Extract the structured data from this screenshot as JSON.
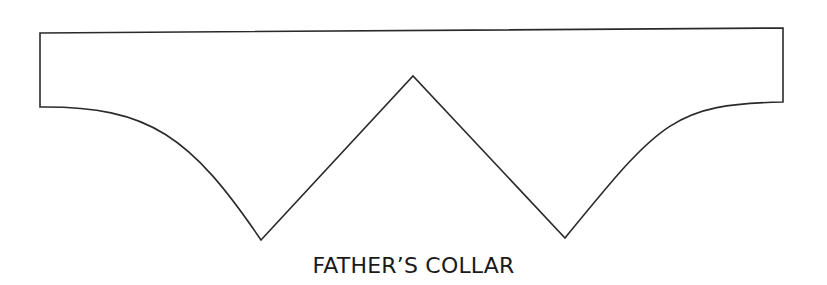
{
  "diagram": {
    "caption": "FATHER’S COLLAR",
    "stroke_color": "#2a2a2a",
    "background_color": "#ffffff",
    "shape": {
      "name": "collar-pattern-outline",
      "points": {
        "top_left": [
          40,
          33
        ],
        "top_right": [
          783,
          28
        ],
        "right_bottom": [
          783,
          102
        ],
        "right_v_tip": [
          565,
          238
        ],
        "apex": [
          413,
          76
        ],
        "left_v_tip": [
          261,
          240
        ],
        "left_bottom": [
          40,
          107
        ]
      }
    }
  }
}
